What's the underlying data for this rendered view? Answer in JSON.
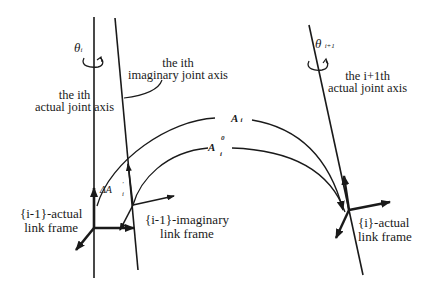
{
  "diagram": {
    "labels": {
      "theta_i": "θ",
      "theta_i_sub": "i",
      "theta_i1": "θ",
      "theta_i1_sub": "i+1",
      "ith_imaginary_axis_line1": "the ith",
      "ith_imaginary_axis_line2": "imaginary joint axis",
      "ith_actual_axis_line1": "the ith",
      "ith_actual_axis_line2": "actual joint axis",
      "i1th_actual_axis_line1": "the i+1th",
      "i1th_actual_axis_line2": "actual joint axis",
      "A_i": "A",
      "A_i_sub": "i",
      "A_i0": "A",
      "A_i0_sup": "0",
      "A_i0_sub": "i",
      "dA_i": "ΔA",
      "dA_i_sup": "'",
      "dA_i_sub": "i",
      "frame_prev_actual_line1": "{i-1}-actual",
      "frame_prev_actual_line2": "link frame",
      "frame_prev_imag_line1": "{i-1}-imaginary",
      "frame_prev_imag_line2": "link frame",
      "frame_i_actual_line1": "{i}-actual",
      "frame_i_actual_line2": "link frame"
    },
    "colors": {
      "ink": "#1a1a1a",
      "background": "#ffffff"
    }
  }
}
